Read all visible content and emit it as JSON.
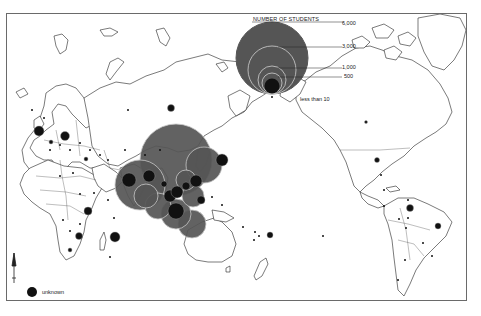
{
  "legend": {
    "title": "NUMBER OF STUDENTS",
    "levels": [
      {
        "label": "6,000",
        "x": 342,
        "y": 22
      },
      {
        "label": "3,000",
        "x": 342,
        "y": 44
      },
      {
        "label": "1,000",
        "x": 342,
        "y": 66
      },
      {
        "label": "500",
        "x": 344,
        "y": 75
      },
      {
        "label": "less than 10",
        "x": 300,
        "y": 98
      }
    ],
    "unknown_label": "unknown"
  },
  "colors": {
    "land_outline": "#222222",
    "bubble_large": "#555555",
    "bubble_small": "#111111",
    "bubble_ring": "#bbbbbb",
    "frame": "#6a6a6a"
  },
  "map": {
    "projection": "Pacific-centered world map",
    "bubbles": [
      {
        "region": "China",
        "cx": 176,
        "cy": 160,
        "r": 36,
        "shade": "dark"
      },
      {
        "region": "India",
        "cx": 140,
        "cy": 185,
        "r": 25,
        "shade": "dark"
      },
      {
        "region": "Japan",
        "cx": 204,
        "cy": 165,
        "r": 18,
        "shade": "dark"
      },
      {
        "region": "Indonesia",
        "cx": 176,
        "cy": 214,
        "r": 15,
        "shade": "dark"
      },
      {
        "region": "Southeast Asia",
        "cx": 158,
        "cy": 206,
        "r": 13,
        "shade": "dark"
      },
      {
        "region": "Philippines",
        "cx": 193,
        "cy": 196,
        "r": 11,
        "shade": "dark"
      },
      {
        "region": "Australia-north",
        "cx": 192,
        "cy": 224,
        "r": 14,
        "shade": "dark"
      },
      {
        "region": "Pakistan",
        "cx": 129,
        "cy": 180,
        "r": 7,
        "shade": "black"
      },
      {
        "region": "Bangladesh",
        "cx": 149,
        "cy": 176,
        "r": 6,
        "shade": "black"
      },
      {
        "region": "Korea",
        "cx": 196,
        "cy": 181,
        "r": 6,
        "shade": "black"
      },
      {
        "region": "Vietnam",
        "cx": 164,
        "cy": 184,
        "r": 3,
        "shade": "black"
      },
      {
        "region": "Malaysia",
        "cx": 170,
        "cy": 196,
        "r": 6,
        "shade": "black"
      },
      {
        "region": "Singapore",
        "cx": 177,
        "cy": 192,
        "r": 6,
        "shade": "black"
      },
      {
        "region": "Indonesia-core",
        "cx": 176,
        "cy": 211,
        "r": 8,
        "shade": "black"
      },
      {
        "region": "Taiwan",
        "cx": 186,
        "cy": 186,
        "r": 4,
        "shade": "black"
      },
      {
        "region": "Papua",
        "cx": 201,
        "cy": 200,
        "r": 4,
        "shade": "black"
      },
      {
        "region": "Hawaii-Pacific",
        "cx": 222,
        "cy": 160,
        "r": 6,
        "shade": "black"
      },
      {
        "region": "Russia-east",
        "cx": 171,
        "cy": 108,
        "r": 3.5,
        "shade": "black"
      },
      {
        "region": "UK",
        "cx": 39,
        "cy": 131,
        "r": 5,
        "shade": "black"
      },
      {
        "region": "Germany",
        "cx": 65,
        "cy": 136,
        "r": 4.5,
        "shade": "black"
      },
      {
        "region": "France",
        "cx": 51,
        "cy": 142,
        "r": 2,
        "shade": "black"
      },
      {
        "region": "Turkey",
        "cx": 86,
        "cy": 159,
        "r": 2,
        "shade": "black"
      },
      {
        "region": "Kenya",
        "cx": 88,
        "cy": 211,
        "r": 4,
        "shade": "black"
      },
      {
        "region": "Madagascar",
        "cx": 115,
        "cy": 237,
        "r": 5,
        "shade": "black"
      },
      {
        "region": "Zimbabwe",
        "cx": 79,
        "cy": 236,
        "r": 3.5,
        "shade": "black"
      },
      {
        "region": "South Africa",
        "cx": 70,
        "cy": 250,
        "r": 2,
        "shade": "black"
      },
      {
        "region": "Fiji",
        "cx": 270,
        "cy": 235,
        "r": 3,
        "shade": "black"
      },
      {
        "region": "Canada",
        "cx": 377,
        "cy": 160,
        "r": 2.5,
        "shade": "black"
      },
      {
        "region": "Colombia",
        "cx": 410,
        "cy": 208,
        "r": 3.5,
        "shade": "black"
      },
      {
        "region": "Brazil",
        "cx": 438,
        "cy": 226,
        "r": 3,
        "shade": "black"
      },
      {
        "region": "Arctic",
        "cx": 366,
        "cy": 122,
        "r": 1.5,
        "shade": "black"
      }
    ],
    "small_dots": [
      [
        32,
        110
      ],
      [
        44,
        118
      ],
      [
        50,
        150
      ],
      [
        60,
        145
      ],
      [
        70,
        150
      ],
      [
        80,
        143
      ],
      [
        90,
        150
      ],
      [
        100,
        155
      ],
      [
        108,
        160
      ],
      [
        60,
        176
      ],
      [
        73,
        173
      ],
      [
        80,
        194
      ],
      [
        94,
        193
      ],
      [
        108,
        200
      ],
      [
        114,
        218
      ],
      [
        63,
        220
      ],
      [
        80,
        224
      ],
      [
        70,
        231
      ],
      [
        110,
        257
      ],
      [
        243,
        227
      ],
      [
        255,
        232
      ],
      [
        259,
        236
      ],
      [
        254,
        240
      ],
      [
        323,
        236
      ],
      [
        384,
        190
      ],
      [
        408,
        200
      ],
      [
        408,
        218
      ],
      [
        406,
        228
      ],
      [
        423,
        243
      ],
      [
        432,
        256
      ],
      [
        405,
        260
      ],
      [
        398,
        280
      ],
      [
        384,
        206
      ],
      [
        399,
        219
      ],
      [
        128,
        110
      ],
      [
        125,
        150
      ],
      [
        145,
        155
      ],
      [
        160,
        150
      ],
      [
        212,
        197
      ],
      [
        222,
        205
      ]
    ],
    "unknown_marker": {
      "cx": 32,
      "cy": 292,
      "r": 5
    }
  }
}
